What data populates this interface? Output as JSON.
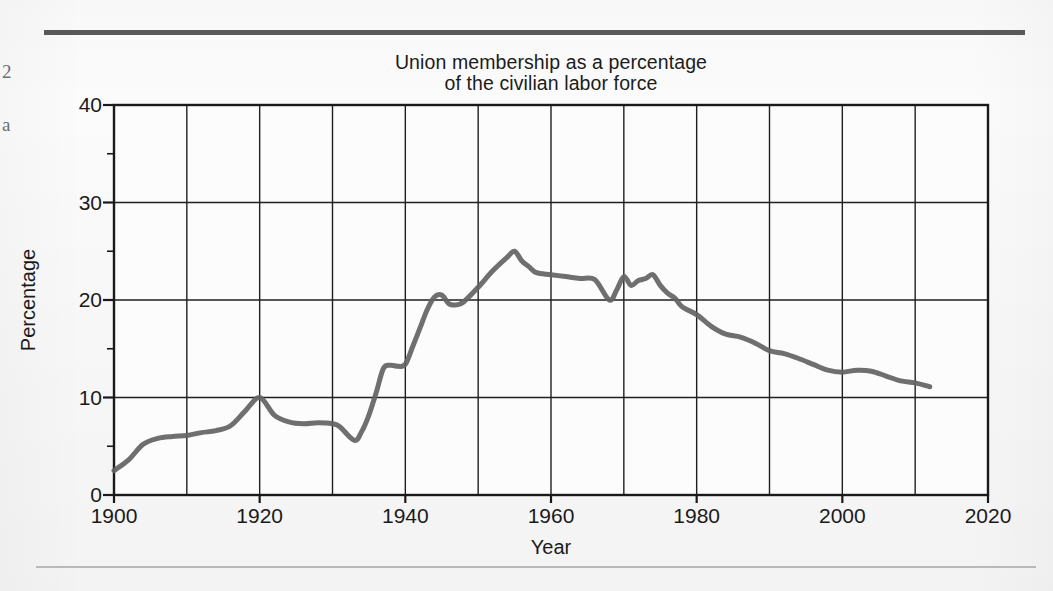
{
  "page": {
    "margin_notes": [
      "2",
      "a"
    ],
    "rules": {
      "top_color": "#595959",
      "bottom_color": "#b9b9b9"
    }
  },
  "chart_data": {
    "type": "line",
    "title": "Union membership as a percentage of the civilian labor force",
    "title_line_1": "Union membership as a percentage",
    "title_line_2": "of the civilian labor force",
    "xlabel": "Year",
    "ylabel": "Percentage",
    "xlim": [
      1900,
      2020
    ],
    "ylim": [
      0,
      40
    ],
    "xticks": [
      1900,
      1920,
      1940,
      1960,
      1980,
      2000,
      2020
    ],
    "xtick_labels": [
      "1900",
      "1920",
      "1940",
      "1960",
      "1980",
      "2000",
      "2020"
    ],
    "yticks": [
      0,
      10,
      20,
      30,
      40
    ],
    "ytick_labels": [
      "0",
      "10",
      "20",
      "30",
      "40"
    ],
    "y_minor_ticks": [
      5,
      15,
      25,
      35
    ],
    "grid": true,
    "grid_x_step": 10,
    "grid_y_step": 10,
    "legend": null,
    "line_color": "#636363",
    "line_width": 5,
    "series": [
      {
        "name": "Union membership",
        "x": [
          1900,
          1902,
          1904,
          1906,
          1908,
          1910,
          1912,
          1914,
          1916,
          1918,
          1920,
          1922,
          1924,
          1926,
          1928,
          1930,
          1931,
          1933,
          1934,
          1935,
          1936,
          1937,
          1938,
          1939,
          1940,
          1941,
          1942,
          1943,
          1944,
          1945,
          1946,
          1947,
          1948,
          1950,
          1952,
          1954,
          1955,
          1956,
          1957,
          1958,
          1960,
          1962,
          1964,
          1966,
          1968,
          1969,
          1970,
          1971,
          1972,
          1973,
          1974,
          1975,
          1976,
          1977,
          1978,
          1980,
          1982,
          1984,
          1986,
          1988,
          1990,
          1992,
          1994,
          1996,
          1998,
          2000,
          2002,
          2004,
          2006,
          2008,
          2010,
          2012
        ],
        "y": [
          2.5,
          3.6,
          5.2,
          5.8,
          6.0,
          6.1,
          6.4,
          6.6,
          7.1,
          8.6,
          10.0,
          8.2,
          7.5,
          7.3,
          7.4,
          7.3,
          7.0,
          5.6,
          6.5,
          8.2,
          10.5,
          13.0,
          13.3,
          13.2,
          13.4,
          15.2,
          17.1,
          19.0,
          20.3,
          20.5,
          19.6,
          19.5,
          19.8,
          21.3,
          23.0,
          24.4,
          25.0,
          24.0,
          23.4,
          22.8,
          22.6,
          22.4,
          22.2,
          22.1,
          20.0,
          21.0,
          22.4,
          21.5,
          22.0,
          22.2,
          22.6,
          21.5,
          20.7,
          20.2,
          19.3,
          18.5,
          17.3,
          16.5,
          16.2,
          15.6,
          14.8,
          14.5,
          14.0,
          13.4,
          12.8,
          12.6,
          12.8,
          12.7,
          12.2,
          11.7,
          11.5,
          11.1
        ]
      }
    ],
    "annotations": []
  }
}
